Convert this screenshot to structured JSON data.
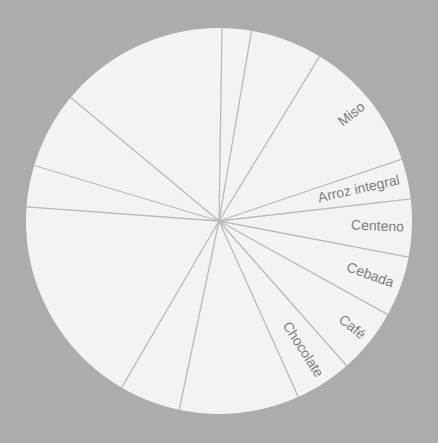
{
  "colors": {
    "background": "#acacac",
    "pie_fill": "#f3f3f3",
    "divider": "#b9b9b9",
    "label": "#7d7d7d"
  },
  "chart_data": {
    "type": "pie",
    "title": "",
    "center": [
      219,
      221
    ],
    "radius": 193,
    "start_angle_deg_clockwise_from_top": 0.9,
    "categories": [
      "",
      "",
      "Miso",
      "Arroz integral",
      "Centeno",
      "Cebada",
      "Café",
      "Chocolate",
      "",
      "",
      "",
      "",
      "",
      ""
    ],
    "values": [
      8.8,
      21.7,
      39.9,
      12.1,
      17.4,
      18.2,
      19.6,
      17.1,
      36.2,
      18.4,
      63.9,
      12.5,
      23.1,
      51.1
    ],
    "value_unit": "degrees",
    "legend": "none",
    "labels_visible": [
      "Miso",
      "Arroz integral",
      "Centeno",
      "Cebada",
      "Café",
      "Chocolate"
    ]
  }
}
